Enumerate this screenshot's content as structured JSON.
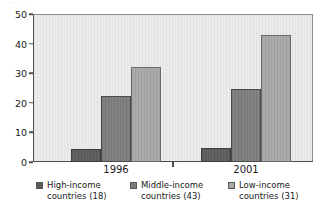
{
  "top_artifact": "··  ··",
  "chart_data": {
    "type": "bar",
    "title": "",
    "subtitle": "",
    "xlabel": "",
    "ylabel": "",
    "categories": [
      "1996",
      "2001"
    ],
    "series": [
      {
        "name": "High-income countries (18)",
        "key": "high",
        "color": "#5c5c5c",
        "values": [
          4.5,
          4.8
        ]
      },
      {
        "name": "Middle-income countries (43)",
        "key": "middle",
        "color": "#7d7d7d",
        "values": [
          22.2,
          24.8
        ]
      },
      {
        "name": "Low-income countries (31)",
        "key": "low",
        "color": "#a8a8a8",
        "values": [
          32.0,
          43.0
        ]
      }
    ],
    "ylim": [
      0,
      50
    ],
    "yticks": [
      0,
      10,
      20,
      30,
      40,
      50
    ],
    "ytick_labels": [
      "0",
      "10",
      "20",
      "30",
      "40",
      "50"
    ],
    "grid": false,
    "legend_position": "bottom",
    "plot_background": "#ececeb",
    "axis_color": "#4d4d4d"
  },
  "legend": [
    {
      "line1": "High-income",
      "line2": "countries (18)",
      "swatch": "dark"
    },
    {
      "line1": "Middle-income",
      "line2": "countries (43)",
      "swatch": "medium"
    },
    {
      "line1": "Low-income",
      "line2": "countries (31)",
      "swatch": "light"
    }
  ]
}
